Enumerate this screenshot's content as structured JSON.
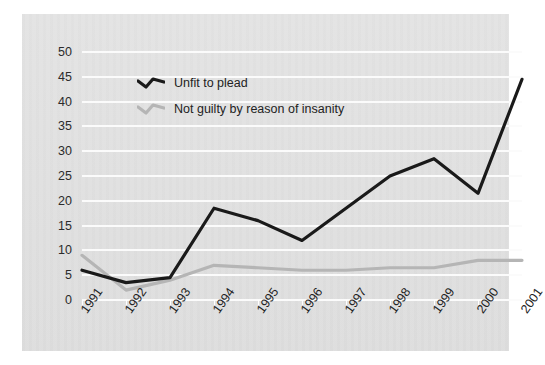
{
  "chart_data": {
    "type": "line",
    "title": "",
    "xlabel": "",
    "ylabel": "",
    "categories": [
      "1991",
      "1992",
      "1993",
      "1994",
      "1995",
      "1996",
      "1997",
      "1998",
      "1999",
      "2000",
      "2001"
    ],
    "ylim": [
      0,
      50
    ],
    "yticks": [
      0,
      5,
      10,
      15,
      20,
      25,
      30,
      35,
      40,
      45,
      50
    ],
    "grid": true,
    "legend_position": "upper-left-inside",
    "series": [
      {
        "name": "Unfit to plead",
        "color": "#1a1a1a",
        "values": [
          6,
          3.5,
          4.5,
          18.5,
          16,
          12,
          18.5,
          25,
          28.5,
          21.5,
          44.5
        ]
      },
      {
        "name": "Not guilty by reason of insanity",
        "color": "#b5b5b5",
        "values": [
          9,
          2,
          4,
          7,
          6.5,
          6,
          6,
          6.5,
          6.5,
          8,
          8
        ]
      }
    ]
  },
  "axes": {
    "y_tick_labels": [
      "50",
      "45",
      "40",
      "35",
      "30",
      "25",
      "20",
      "15",
      "10",
      "5",
      "0"
    ],
    "x_tick_labels": [
      "1991",
      "1992",
      "1993",
      "1994",
      "1995",
      "1996",
      "1997",
      "1998",
      "1999",
      "2000",
      "2001"
    ]
  },
  "legend": {
    "items": [
      {
        "label": "Unfit to plead",
        "color": "#1a1a1a"
      },
      {
        "label": "Not guilty by reason of insanity",
        "color": "#b5b5b5"
      }
    ]
  },
  "colors": {
    "panel_background": "#e2e2e2",
    "page_background": "#ffffff",
    "gridline": "#fbfbfb",
    "series_dark": "#1a1a1a",
    "series_light": "#b5b5b5",
    "text": "#222222"
  }
}
